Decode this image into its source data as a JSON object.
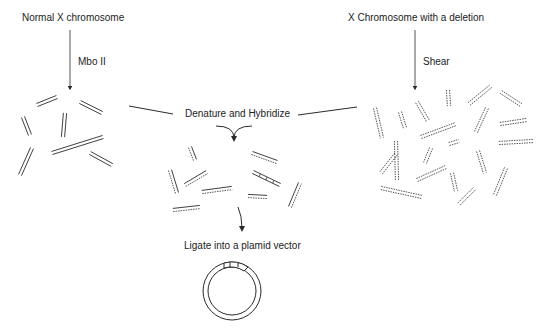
{
  "labels": {
    "normal": "Normal X chromosome",
    "mbo": "Mbo II",
    "deletion": "X Chromosome with a deletion",
    "shear": "Shear",
    "denature": "Denature and Hybridize",
    "ligate": "Ligate into a plamid vector"
  },
  "colors": {
    "line": "#2a2a2a",
    "text": "#222222"
  },
  "fragments": {
    "left_solid": [
      [
        37,
        105,
        57,
        97
      ],
      [
        80,
        102,
        102,
        113
      ],
      [
        23,
        117,
        30,
        135
      ],
      [
        65,
        113,
        63,
        137
      ],
      [
        52,
        153,
        103,
        137
      ],
      [
        90,
        153,
        112,
        165
      ],
      [
        32,
        148,
        20,
        175
      ]
    ],
    "middle_hybrid": [
      [
        190,
        147,
        195,
        160
      ],
      [
        170,
        170,
        177,
        193
      ],
      [
        185,
        185,
        207,
        172
      ],
      [
        202,
        192,
        232,
        188
      ],
      [
        252,
        153,
        277,
        162
      ],
      [
        248,
        196,
        267,
        197
      ],
      [
        290,
        207,
        300,
        183
      ],
      [
        173,
        210,
        200,
        207
      ]
    ],
    "middle_ladder": [
      253,
      172,
      280,
      185
    ],
    "right_dotted": [
      [
        375,
        108,
        382,
        138
      ],
      [
        400,
        112,
        405,
        128
      ],
      [
        417,
        102,
        428,
        121
      ],
      [
        448,
        90,
        449,
        106
      ],
      [
        469,
        104,
        491,
        86
      ],
      [
        501,
        92,
        521,
        105
      ],
      [
        487,
        108,
        476,
        132
      ],
      [
        500,
        124,
        527,
        120
      ],
      [
        421,
        137,
        456,
        124
      ],
      [
        449,
        144,
        459,
        141
      ],
      [
        499,
        143,
        533,
        141
      ],
      [
        396,
        154,
        381,
        173
      ],
      [
        396,
        141,
        397,
        180
      ],
      [
        431,
        148,
        425,
        163
      ],
      [
        478,
        151,
        485,
        173
      ],
      [
        417,
        180,
        446,
        167
      ],
      [
        452,
        173,
        456,
        191
      ],
      [
        506,
        168,
        495,
        195
      ],
      [
        381,
        188,
        422,
        197
      ],
      [
        459,
        204,
        475,
        188
      ]
    ]
  }
}
